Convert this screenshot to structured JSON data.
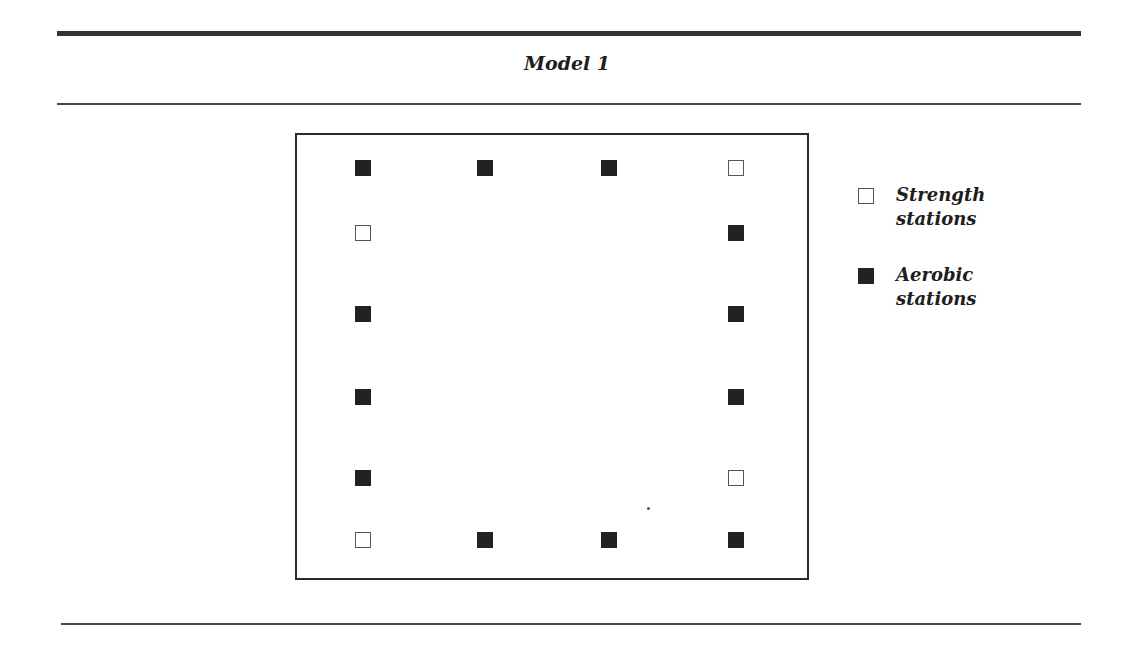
{
  "figure": {
    "title": "Model 1"
  },
  "legend": {
    "items": [
      {
        "type": "strength",
        "label": "Strength\nstations"
      },
      {
        "type": "aerobic",
        "label": "Aerobic\nstations"
      }
    ]
  },
  "stations": {
    "columns_x": [
      355,
      477,
      601,
      728
    ],
    "rows_y": [
      160,
      225,
      306,
      389,
      470,
      532
    ],
    "items": [
      {
        "row": 0,
        "col": 0,
        "type": "aerobic"
      },
      {
        "row": 0,
        "col": 1,
        "type": "aerobic"
      },
      {
        "row": 0,
        "col": 2,
        "type": "aerobic"
      },
      {
        "row": 0,
        "col": 3,
        "type": "strength"
      },
      {
        "row": 1,
        "col": 0,
        "type": "strength"
      },
      {
        "row": 1,
        "col": 3,
        "type": "aerobic"
      },
      {
        "row": 2,
        "col": 0,
        "type": "aerobic"
      },
      {
        "row": 2,
        "col": 3,
        "type": "aerobic"
      },
      {
        "row": 3,
        "col": 0,
        "type": "aerobic"
      },
      {
        "row": 3,
        "col": 3,
        "type": "aerobic"
      },
      {
        "row": 4,
        "col": 0,
        "type": "aerobic"
      },
      {
        "row": 4,
        "col": 3,
        "type": "strength"
      },
      {
        "row": 5,
        "col": 0,
        "type": "strength"
      },
      {
        "row": 5,
        "col": 1,
        "type": "aerobic"
      },
      {
        "row": 5,
        "col": 2,
        "type": "aerobic"
      },
      {
        "row": 5,
        "col": 3,
        "type": "aerobic"
      }
    ],
    "counts": {
      "strength": 4,
      "aerobic": 12
    }
  },
  "colors": {
    "aerobic_fill": "#222222",
    "strength_fill": "#ffffff",
    "strength_border": "#555555",
    "rule": "#333333"
  }
}
